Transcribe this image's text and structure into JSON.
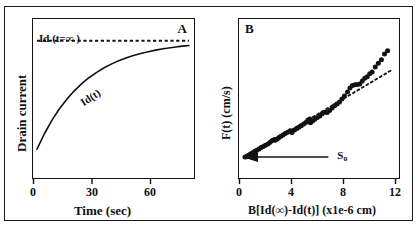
{
  "figure": {
    "width": 419,
    "height": 227,
    "background": "#ffffff",
    "ink_color": "#111111",
    "panels": [
      "A",
      "B"
    ]
  },
  "panel_a": {
    "letter": "A",
    "xlabel": "Time (sec)",
    "ylabel": "Drain current",
    "xticks": [
      "0",
      "30",
      "60"
    ],
    "curve_label": "Id(t)",
    "asymptote_label": "Id (t=∞ )"
  },
  "panel_b": {
    "letter": "B",
    "xlabel": "B[Id(∞)-Id(t)]  (x1e-6 cm)",
    "ylabel": "F(t)  (cm/s)",
    "xticks": [
      "0",
      "4",
      "8",
      "12"
    ],
    "arrow_label": "S",
    "arrow_label_sub": "o"
  },
  "chart_data": [
    {
      "type": "line",
      "panel": "A",
      "title": "A",
      "xlabel": "Time (sec)",
      "ylabel": "Drain current",
      "xlim": [
        0,
        82
      ],
      "ylim": [
        0,
        1.12
      ],
      "xticks": [
        0,
        30,
        60
      ],
      "xtick_labels": [
        "0",
        "30",
        "60"
      ],
      "yticks": [],
      "grid": false,
      "legend": false,
      "series": [
        {
          "name": "Id(t)",
          "style": "solid",
          "annotation": "Id(t)",
          "description": "Saturating exponential rise Id(t) = 0.18 + 0.82*(1 - exp(-t/26))",
          "x": [
            0,
            4,
            8,
            12,
            16,
            20,
            24,
            28,
            32,
            36,
            40,
            44,
            48,
            52,
            56,
            60,
            64,
            68,
            72,
            76,
            80,
            82
          ],
          "y": [
            0.18,
            0.297,
            0.398,
            0.484,
            0.557,
            0.62,
            0.674,
            0.721,
            0.76,
            0.795,
            0.824,
            0.849,
            0.87,
            0.889,
            0.905,
            0.918,
            0.93,
            0.94,
            0.948,
            0.956,
            0.962,
            0.965
          ]
        },
        {
          "name": "Id (t=∞ )",
          "style": "dotted-horizontal",
          "annotation": "Id (t=∞ )",
          "description": "Horizontal dashed asymptote at saturation current",
          "x": [
            0,
            82
          ],
          "y": [
            1.0,
            1.0
          ]
        }
      ]
    },
    {
      "type": "scatter",
      "panel": "B",
      "title": "B",
      "xlabel": "B[Id(∞)-Id(t)]  (x1e-6 cm)",
      "ylabel": "F(t)  (cm/s)",
      "xlim": [
        0,
        12.4
      ],
      "ylim": [
        0,
        1.08
      ],
      "xticks": [
        0,
        4,
        8,
        12
      ],
      "xtick_labels": [
        "0",
        "4",
        "8",
        "12"
      ],
      "yticks": [],
      "grid": false,
      "legend": false,
      "annotations": [
        {
          "text": "So",
          "type": "arrow",
          "description": "Leftward arrow from x=7.0 to the y-axis intercept marking S₀"
        }
      ],
      "series": [
        {
          "name": "F(t) data",
          "style": "filled-circles",
          "x": [
            0.25,
            0.35,
            0.42,
            0.5,
            0.58,
            0.66,
            0.78,
            0.9,
            1.05,
            1.2,
            1.38,
            1.55,
            1.72,
            1.9,
            2.1,
            2.28,
            2.45,
            2.62,
            2.7,
            2.85,
            3.0,
            3.15,
            3.32,
            3.5,
            3.7,
            3.9,
            4.05,
            4.25,
            4.45,
            4.6,
            4.8,
            5.0,
            5.2,
            5.35,
            5.5,
            5.55,
            5.72,
            5.9,
            6.1,
            6.3,
            6.5,
            6.7,
            6.9,
            7.1,
            7.3,
            7.5,
            7.7,
            7.9,
            8.1,
            8.3,
            8.55,
            8.75,
            8.95,
            9.15,
            9.35,
            9.55,
            9.75,
            9.95,
            10.15,
            10.35,
            10.55,
            10.8,
            11.05,
            11.3,
            11.55,
            11.8
          ],
          "y": [
            0.118,
            0.12,
            0.125,
            0.128,
            0.132,
            0.138,
            0.145,
            0.152,
            0.16,
            0.168,
            0.178,
            0.188,
            0.196,
            0.205,
            0.215,
            0.228,
            0.24,
            0.248,
            0.242,
            0.252,
            0.262,
            0.272,
            0.282,
            0.292,
            0.302,
            0.312,
            0.3,
            0.318,
            0.33,
            0.338,
            0.35,
            0.362,
            0.375,
            0.392,
            0.4,
            0.372,
            0.385,
            0.398,
            0.41,
            0.422,
            0.438,
            0.45,
            0.448,
            0.462,
            0.48,
            0.498,
            0.51,
            0.525,
            0.548,
            0.57,
            0.6,
            0.628,
            0.648,
            0.652,
            0.655,
            0.658,
            0.68,
            0.7,
            0.712,
            0.735,
            0.748,
            0.785,
            0.812,
            0.838,
            0.88,
            0.905
          ]
        },
        {
          "name": "linear fit",
          "style": "dotted",
          "description": "Dotted straight line through low-x data, slope extrapolated to x=12",
          "x": [
            0.3,
            12.1
          ],
          "y": [
            0.118,
            0.76
          ]
        }
      ]
    }
  ]
}
